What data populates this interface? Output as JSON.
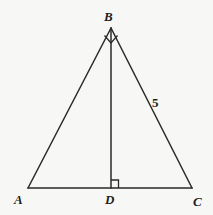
{
  "figure": {
    "kind": "geometry-diagram",
    "background_color": "#f7f7f5",
    "stroke_color": "#2a2a2a",
    "label_color": "#1d1d1d"
  },
  "points": {
    "A": {
      "label": "A",
      "x": 28,
      "y": 188
    },
    "B": {
      "label": "B",
      "x": 111,
      "y": 28
    },
    "C": {
      "label": "C",
      "x": 192,
      "y": 188
    },
    "D": {
      "label": "D",
      "x": 111,
      "y": 188
    }
  },
  "segments": [
    {
      "name": "AB",
      "from": "A",
      "to": "B"
    },
    {
      "name": "BC",
      "from": "B",
      "to": "C"
    },
    {
      "name": "AC",
      "from": "A",
      "to": "C"
    },
    {
      "name": "BD",
      "from": "B",
      "to": "D"
    }
  ],
  "measures": {
    "side_bc_length": "5"
  },
  "angle_markers": [
    {
      "name": "right-angle-at-D",
      "at": "D",
      "type": "square"
    },
    {
      "name": "right-angle-at-B",
      "at": "B",
      "type": "square-rotated"
    }
  ]
}
